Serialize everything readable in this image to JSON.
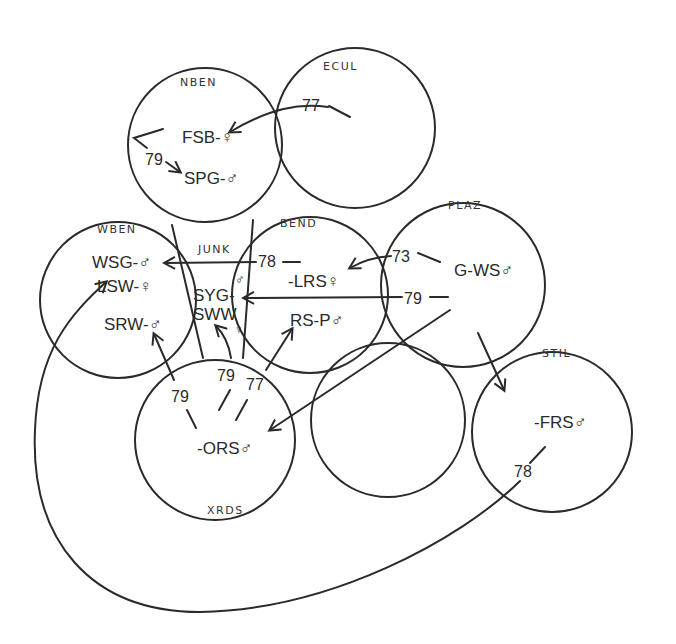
{
  "diagram": {
    "type": "territory-movement-map",
    "regions": [
      {
        "id": "NBEN",
        "label": "NBEN",
        "cx": 205,
        "cy": 145,
        "r": 77,
        "residents": [
          "FSB-♀",
          "SPG-♂"
        ]
      },
      {
        "id": "ECUL",
        "label": "ECUL",
        "cx": 355,
        "cy": 128,
        "r": 80,
        "residents": []
      },
      {
        "id": "WBEN",
        "label": "WBEN",
        "cx": 118,
        "cy": 300,
        "r": 78,
        "residents": [
          "WSG-♂",
          "LSW-♀",
          "SRW-♂"
        ]
      },
      {
        "id": "JUNK",
        "label": "JUNK",
        "residents": [
          "SYG-♂",
          "SWW-♀"
        ]
      },
      {
        "id": "BEND",
        "label": "BEND",
        "cx": 310,
        "cy": 295,
        "r": 78,
        "residents": [
          "-LRS♀",
          "RS-P♂"
        ]
      },
      {
        "id": "PLAZ",
        "label": "PLAZ",
        "cx": 463,
        "cy": 285,
        "r": 82,
        "residents": [
          "G-WS♂"
        ]
      },
      {
        "id": "XRDS",
        "label": "XRDS",
        "cx": 215,
        "cy": 440,
        "r": 80,
        "residents": [
          "-ORS♂"
        ]
      },
      {
        "id": "UNNAMED",
        "label": "",
        "cx": 388,
        "cy": 420,
        "r": 77,
        "residents": []
      },
      {
        "id": "STIL",
        "label": "STIL",
        "cx": 552,
        "cy": 432,
        "r": 80,
        "residents": [
          "-FRS♂"
        ]
      }
    ],
    "labels": {
      "nben": "NBEN",
      "ecul": "ECUL",
      "wben": "WBEN",
      "junk": "JUNK",
      "bend": "BEND",
      "plaz": "PLAZ",
      "xrds": "XRDS",
      "stil": "STIL"
    },
    "nodes": {
      "fsb": "FSB-♀",
      "spg": "SPG-♂",
      "wsg": "WSG-♂",
      "lsw": "LSW-♀",
      "srw": "SRW-♂",
      "syg": "SYG-",
      "syg_sex": "♂",
      "sww": "SWW",
      "sww_sex": "♀",
      "lrs": "-LRS♀",
      "rsp": "RS-P♂",
      "gws": "G-WS♂",
      "ors": "-ORS♂",
      "frs": "-FRS♂"
    },
    "movements": [
      {
        "year": "77",
        "from": "ECUL",
        "to": "FSB (NBEN)"
      },
      {
        "year": "79",
        "from": "NBEN",
        "to": "SPG (NBEN)"
      },
      {
        "year": "78",
        "from": "BEND",
        "to": "WSG (WBEN)"
      },
      {
        "year": "73",
        "from": "PLAZ",
        "to": "LRS (BEND)"
      },
      {
        "year": "79",
        "from": "PLAZ",
        "to": "SYG (JUNK)"
      },
      {
        "year": "79",
        "from": "XRDS",
        "to": "SRW (WBEN)"
      },
      {
        "year": "79",
        "from": "XRDS",
        "to": "SWW (JUNK)"
      },
      {
        "year": "77",
        "from": "XRDS",
        "to": "RS-P (BEND)"
      },
      {
        "year": "",
        "from": "PLAZ",
        "to": "ORS (XRDS)"
      },
      {
        "year": "",
        "from": "PLAZ",
        "to": "FRS (STIL)"
      },
      {
        "year": "78",
        "from": "STIL",
        "to": "LSW (WBEN)"
      }
    ],
    "years": {
      "y_ecul_fsb": "77",
      "y_nben_spg": "79",
      "y_bend_wsg": "78",
      "y_plaz_lrs": "73",
      "y_plaz_syg": "79",
      "y_xrds_srw": "79",
      "y_xrds_sww": "79",
      "y_xrds_rsp": "77",
      "y_stil_lsw": "78"
    }
  }
}
